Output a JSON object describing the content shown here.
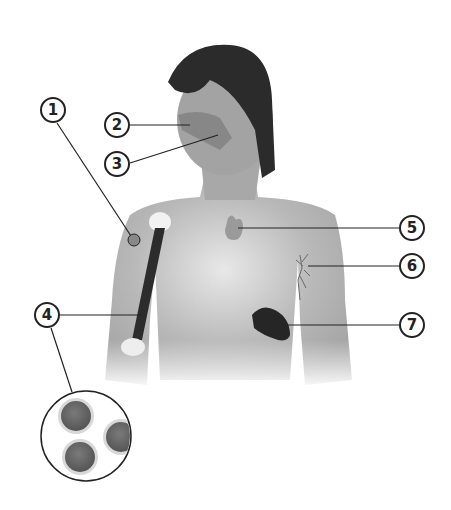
{
  "diagram": {
    "colors": {
      "background": "#ffffff",
      "skin": "#a9a9a9",
      "hair": "#2a2a2a",
      "organ_dark": "#2b2b2b",
      "outline": "#222222"
    },
    "callouts": [
      {
        "id": 1,
        "label": "1",
        "x": 53,
        "y": 110,
        "target": "upper-arm (lymph node near shoulder)"
      },
      {
        "id": 2,
        "label": "2",
        "x": 117,
        "y": 125,
        "target": "nasal / adenoid area"
      },
      {
        "id": 3,
        "label": "3",
        "x": 117,
        "y": 164,
        "target": "tonsil / throat area"
      },
      {
        "id": 4,
        "label": "4",
        "x": 47,
        "y": 315,
        "target": "bone marrow (humerus) with cell magnification"
      },
      {
        "id": 5,
        "label": "5",
        "x": 412,
        "y": 228,
        "target": "thymus"
      },
      {
        "id": 6,
        "label": "6",
        "x": 412,
        "y": 266,
        "target": "lymph vessels"
      },
      {
        "id": 7,
        "label": "7",
        "x": 412,
        "y": 325,
        "target": "spleen"
      }
    ],
    "magnifier": {
      "cx": 86,
      "cy": 436,
      "r": 45,
      "cell_count": 3
    }
  }
}
